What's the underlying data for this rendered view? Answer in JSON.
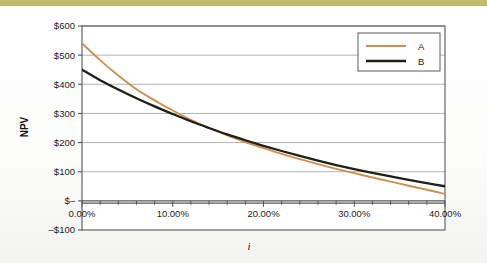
{
  "page": {
    "background_color": "#ffffff",
    "top_band_color": "#c0ba6d"
  },
  "chart_data": {
    "type": "line",
    "title": "",
    "subtitle": "",
    "xlabel": "i",
    "ylabel": "NPV",
    "xlim": [
      0,
      40
    ],
    "ylim": [
      -100,
      600
    ],
    "x_tick_labels": [
      "0.00%",
      "10.00%",
      "20.00%",
      "30.00%",
      "40.00%"
    ],
    "x_tick_values": [
      0,
      10,
      20,
      30,
      40
    ],
    "x_minor_tick_step": 2,
    "y_tick_labels": [
      "$600",
      "$500",
      "$400",
      "$300",
      "$200",
      "$100",
      "$–",
      "–$100"
    ],
    "y_tick_values": [
      600,
      500,
      400,
      300,
      200,
      100,
      0,
      -100
    ],
    "grid": "horizontal",
    "legend_position": "top-right",
    "plot_background": "#ffffff",
    "gridline_color": "#a9a9a9",
    "frame_color": "#56565a",
    "x": [
      0,
      2,
      4,
      6,
      8,
      10,
      12,
      14,
      16,
      18,
      20,
      22,
      24,
      26,
      28,
      30,
      32,
      34,
      36,
      38,
      40
    ],
    "series": [
      {
        "name": "A",
        "color": "#cf8f4e",
        "values": [
          540,
          483,
          430,
          383,
          345,
          310,
          278,
          250,
          225,
          202,
          181,
          161,
          143,
          126,
          110,
          95,
          80,
          66,
          52,
          38,
          24
        ]
      },
      {
        "name": "B",
        "color": "#1f1f1a",
        "values": [
          450,
          414,
          382,
          352,
          324,
          298,
          273,
          250,
          228,
          208,
          189,
          171,
          154,
          138,
          123,
          109,
          96,
          84,
          72,
          61,
          50
        ]
      }
    ],
    "series_note": "A starts higher (~$540) and falls more steeply, crossing B near i=17% and crossing $0 near i=34%. B starts at ~$450 and flattens, reaching ~$0 at i=40%."
  },
  "legend": {
    "entries": [
      {
        "label": "A",
        "color": "#cf8f4e"
      },
      {
        "label": "B",
        "color": "#1f1f1a"
      }
    ]
  }
}
